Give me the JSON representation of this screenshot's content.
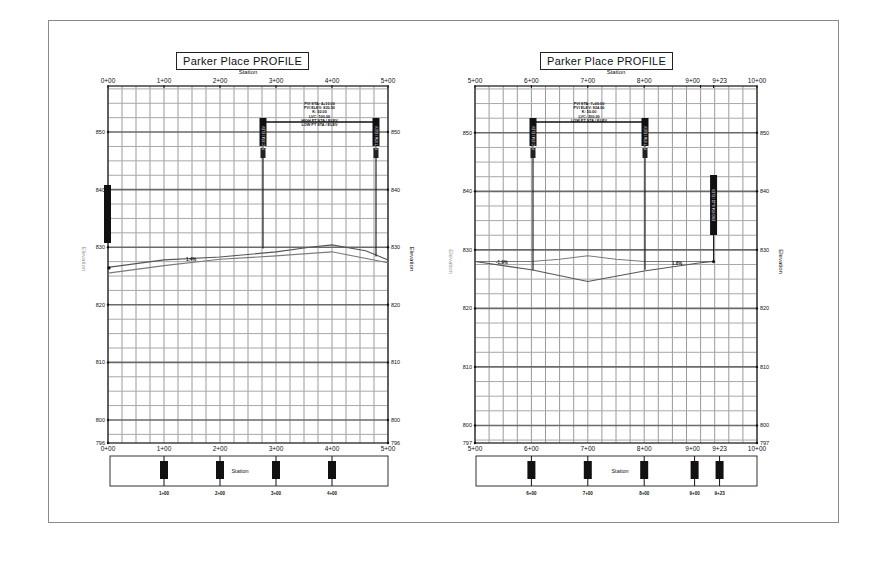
{
  "page": {
    "frame_color": "#8a8a8a",
    "background": "#ffffff"
  },
  "charts": [
    {
      "title": "Parker Place PROFILE",
      "top_axis_label": "Station",
      "bottom_axis_label": "Station",
      "left_axis_label": "Elevation",
      "right_axis_label": "Elevation",
      "station_ticks": [
        "0+00",
        "1+00",
        "2+00",
        "3+00",
        "4+00",
        "5+00"
      ],
      "elevation_ticks_left": [
        "850",
        "840",
        "830",
        "820",
        "810",
        "800",
        "796"
      ],
      "elevation_ticks_right": [
        "850",
        "840",
        "830",
        "820",
        "810",
        "800",
        "796"
      ],
      "grade_label": "1.4%",
      "pvi_labels": [
        "PVI STA: 4+10.00",
        "PVI ELEV: 830.50",
        "K: 50.00",
        "LVC: 100.00",
        "HIGH PT STA / ELEV",
        "LOW PT STA / ELEV"
      ],
      "pvc_label": "PVC STA / ELEV",
      "pvt_label": "PVT STA / ELEV",
      "station_box_label": "Station",
      "station_box_marks": [
        "1+00",
        "2+00",
        "3+00",
        "4+00"
      ]
    },
    {
      "title": "Parker Place PROFILE",
      "top_axis_label": "Station",
      "bottom_axis_label": "Station",
      "left_axis_label": "Elevation",
      "right_axis_label": "Elevation",
      "station_ticks": [
        "5+00",
        "6+00",
        "7+00",
        "8+00",
        "9+00",
        "9+23",
        "10+00"
      ],
      "elevation_ticks_left": [
        "850",
        "840",
        "830",
        "820",
        "810",
        "800",
        "797"
      ],
      "elevation_ticks_right": [
        "850",
        "840",
        "830",
        "820",
        "810",
        "800",
        "797"
      ],
      "grade_label": "-1.9%",
      "grade_label_2": "1.8%",
      "pvi_labels": [
        "PVI STA: 7+00.00",
        "PVI ELEV: 824.00",
        "K: 50.00",
        "LVC: 200.00",
        "LOW PT STA / ELEV"
      ],
      "pvc_label": "PVC STA / ELEV",
      "pvt_label": "PVT STA / ELEV",
      "end_label": "END STA 9+23 / ELEV",
      "station_box_label": "Station",
      "station_box_marks": [
        "6+00",
        "7+00",
        "8+00",
        "9+00",
        "9+23"
      ]
    }
  ],
  "chart_data": [
    {
      "type": "line",
      "title": "Parker Place PROFILE",
      "xlabel": "Station",
      "ylabel": "Elevation",
      "x_ticks": [
        "0+00",
        "1+00",
        "2+00",
        "3+00",
        "4+00",
        "5+00"
      ],
      "y_ticks": [
        796,
        800,
        810,
        820,
        830,
        840,
        850
      ],
      "xlim": [
        0,
        500
      ],
      "ylim": [
        796,
        858
      ],
      "grid": true,
      "series": [
        {
          "name": "Existing Ground",
          "x": [
            0,
            100,
            200,
            300,
            400,
            500
          ],
          "y": [
            825.5,
            826.8,
            827.9,
            828.5,
            829.2,
            827.3
          ]
        },
        {
          "name": "Proposed Profile",
          "x": [
            0,
            100,
            200,
            300,
            360,
            400,
            460,
            500
          ],
          "y": [
            826.5,
            827.8,
            828.3,
            829.2,
            830.0,
            830.4,
            829.4,
            827.8
          ]
        }
      ],
      "annotations": [
        "PVC",
        "PVI",
        "PVT",
        "1.4%"
      ]
    },
    {
      "type": "line",
      "title": "Parker Place PROFILE",
      "xlabel": "Station",
      "ylabel": "Elevation",
      "x_ticks": [
        "5+00",
        "6+00",
        "7+00",
        "8+00",
        "9+00",
        "9+23",
        "10+00"
      ],
      "y_ticks": [
        797,
        800,
        810,
        820,
        830,
        840,
        850
      ],
      "xlim": [
        500,
        1000
      ],
      "ylim": [
        797,
        858
      ],
      "grid": true,
      "series": [
        {
          "name": "Existing Ground",
          "x": [
            500,
            600,
            650,
            700,
            750,
            800,
            900,
            923
          ],
          "y": [
            828.0,
            828.0,
            828.4,
            829.0,
            828.4,
            828.0,
            828.0,
            828.0
          ]
        },
        {
          "name": "Proposed Profile",
          "x": [
            500,
            600,
            700,
            800,
            900,
            923
          ],
          "y": [
            828.0,
            826.6,
            824.6,
            826.4,
            827.8,
            828.0
          ]
        }
      ],
      "annotations": [
        "PVC",
        "PVI",
        "PVT",
        "END 9+23",
        "-1.9%",
        "1.8%"
      ]
    }
  ]
}
